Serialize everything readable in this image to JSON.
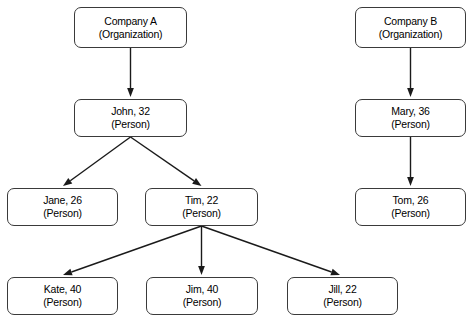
{
  "diagram": {
    "background_color": "#ffffff",
    "node_border_color": "#3a3a3a",
    "node_fill_color": "#ffffff",
    "edge_color": "#1a1a1a",
    "nodes": [
      {
        "id": "companyA",
        "title": "Company A",
        "type": "(Organization)",
        "x": 74,
        "y": 7,
        "w": 113,
        "h": 41
      },
      {
        "id": "companyB",
        "title": "Company B",
        "type": "(Organization)",
        "x": 355,
        "y": 7,
        "w": 111,
        "h": 41
      },
      {
        "id": "john",
        "title": "John, 32",
        "type": "(Person)",
        "x": 74,
        "y": 99,
        "w": 113,
        "h": 38
      },
      {
        "id": "mary",
        "title": "Mary, 36",
        "type": "(Person)",
        "x": 355,
        "y": 99,
        "w": 111,
        "h": 38
      },
      {
        "id": "jane",
        "title": "Jane, 26",
        "type": "(Person)",
        "x": 7,
        "y": 188,
        "w": 111,
        "h": 38
      },
      {
        "id": "tim",
        "title": "Tim, 22",
        "type": "(Person)",
        "x": 145,
        "y": 188,
        "w": 113,
        "h": 38
      },
      {
        "id": "tom",
        "title": "Tom, 26",
        "type": "(Person)",
        "x": 355,
        "y": 188,
        "w": 111,
        "h": 38
      },
      {
        "id": "kate",
        "title": "Kate, 40",
        "type": "(Person)",
        "x": 7,
        "y": 277,
        "w": 111,
        "h": 38
      },
      {
        "id": "jim",
        "title": "Jim, 40",
        "type": "(Person)",
        "x": 146,
        "y": 277,
        "w": 112,
        "h": 38
      },
      {
        "id": "jill",
        "title": "Jill, 22",
        "type": "(Person)",
        "x": 287,
        "y": 277,
        "w": 111,
        "h": 38
      }
    ],
    "edges": [
      {
        "id": "companyA-john",
        "from": "companyA",
        "to": "john",
        "x1": 130.5,
        "y1": 48,
        "x2": 130.5,
        "y2": 97
      },
      {
        "id": "companyB-mary",
        "from": "companyB",
        "to": "mary",
        "x1": 410.5,
        "y1": 48,
        "x2": 410.5,
        "y2": 97
      },
      {
        "id": "john-jane",
        "from": "john",
        "to": "jane",
        "x1": 130.5,
        "y1": 137,
        "x2": 63,
        "y2": 186
      },
      {
        "id": "john-tim",
        "from": "john",
        "to": "tim",
        "x1": 130.5,
        "y1": 137,
        "x2": 201.5,
        "y2": 186
      },
      {
        "id": "mary-tom",
        "from": "mary",
        "to": "tom",
        "x1": 410.5,
        "y1": 137,
        "x2": 410.5,
        "y2": 186
      },
      {
        "id": "tim-kate",
        "from": "tim",
        "to": "kate",
        "x1": 201.5,
        "y1": 226,
        "x2": 63,
        "y2": 275
      },
      {
        "id": "tim-jim",
        "from": "tim",
        "to": "jim",
        "x1": 201.5,
        "y1": 226,
        "x2": 201.5,
        "y2": 275
      },
      {
        "id": "tim-jill",
        "from": "tim",
        "to": "jill",
        "x1": 201.5,
        "y1": 226,
        "x2": 340,
        "y2": 275
      }
    ]
  }
}
